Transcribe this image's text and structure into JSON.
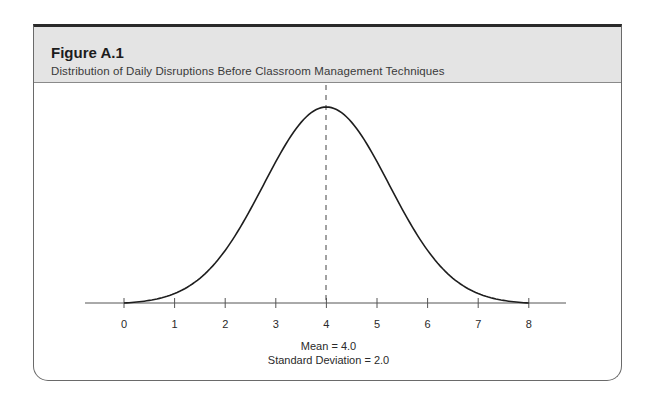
{
  "figure": {
    "label": "Figure A.1",
    "caption": "Distribution of Daily Disruptions Before Classroom Management Techniques",
    "annotations": {
      "mean": "Mean = 4.0",
      "sd": "Standard  Deviation = 2.0"
    }
  },
  "chart_data": {
    "type": "line",
    "title": "Distribution of Daily Disruptions Before Classroom Management Techniques",
    "subtitle": "Figure A.1",
    "xlabel": "",
    "ylabel": "",
    "x_ticks": [
      0,
      1,
      2,
      3,
      4,
      5,
      6,
      7,
      8
    ],
    "x_tick_labels": [
      "0",
      "1",
      "2",
      "3",
      "4",
      "5",
      "6",
      "7",
      "8"
    ],
    "xlim": [
      0,
      8
    ],
    "grid": false,
    "legend": null,
    "series": [
      {
        "name": "normal distribution curve",
        "distribution": "normal",
        "mean": 4.0,
        "sd": 2.0,
        "x": [
          0,
          0.5,
          1,
          1.5,
          2,
          2.5,
          3,
          3.5,
          4,
          4.5,
          5,
          5.5,
          6,
          6.5,
          7,
          7.5,
          8
        ],
        "y_relative": [
          0.0,
          0.06,
          0.13,
          0.22,
          0.32,
          0.46,
          0.63,
          0.86,
          1.0,
          0.86,
          0.63,
          0.46,
          0.32,
          0.22,
          0.13,
          0.06,
          0.0
        ]
      }
    ],
    "reference_lines": [
      {
        "type": "vertical",
        "x": 4.0,
        "style": "dashed",
        "label": "Mean"
      }
    ],
    "annotations": [
      "Mean = 4.0",
      "Standard  Deviation = 2.0"
    ]
  }
}
